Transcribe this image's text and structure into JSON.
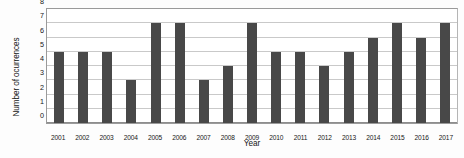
{
  "chart_data": {
    "type": "bar",
    "title": "",
    "xlabel": "Year",
    "ylabel": "Number of ocurrences",
    "categories": [
      "2001",
      "2002",
      "2003",
      "2004",
      "2005",
      "2006",
      "2007",
      "2008",
      "2009",
      "2010",
      "2011",
      "2012",
      "2013",
      "2014",
      "2015",
      "2016",
      "2017"
    ],
    "values": [
      5,
      5,
      5,
      3,
      7,
      7,
      3,
      4,
      7,
      5,
      5,
      4,
      5,
      6,
      7,
      6,
      7
    ],
    "series": [
      {
        "name": "Number of ocurrences",
        "values": [
          5,
          5,
          5,
          3,
          7,
          7,
          3,
          4,
          7,
          5,
          5,
          4,
          5,
          6,
          7,
          6,
          7
        ]
      }
    ],
    "ylim": [
      0,
      8
    ],
    "xlim_labels": [
      "2001",
      "2017"
    ],
    "y_ticks": [
      0,
      1,
      2,
      3,
      4,
      5,
      6,
      7,
      8
    ],
    "y_tick_labels": [
      "0",
      "1",
      "2",
      "3",
      "4",
      "5",
      "6",
      "7",
      "8"
    ],
    "grid": true,
    "grid_axis": "y",
    "legend": false,
    "legend_position": "none",
    "bar_color": "#484848",
    "gridline_color": "#c9c9c9",
    "plot_border_color": "#9a9a9a",
    "background_color": "#ffffff",
    "annotations": []
  }
}
